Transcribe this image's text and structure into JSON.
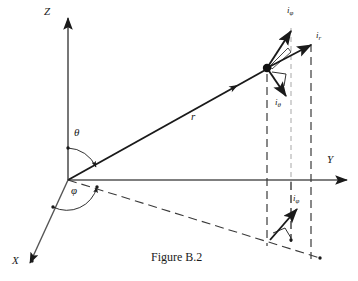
{
  "figure": {
    "caption": "Figure B.2",
    "caption_x": 151,
    "caption_y": 251,
    "background": "#ffffff",
    "stroke": "#1a1a1a",
    "dash_stroke": "#555555"
  },
  "axes": [
    {
      "name": "z-axis",
      "label": "Z",
      "label_x": 48,
      "label_y": 12,
      "x1": 68,
      "y1": 180,
      "x2": 68,
      "y2": 18
    },
    {
      "name": "y-axis",
      "label": "Y",
      "label_x": 329,
      "label_y": 160,
      "x1": 68,
      "y1": 180,
      "x2": 347,
      "y2": 180
    },
    {
      "name": "x-axis",
      "label": "X",
      "label_x": 14,
      "label_y": 261,
      "x1": 68,
      "y1": 180,
      "x2": 30,
      "y2": 265
    }
  ],
  "angles": [
    {
      "name": "theta",
      "label": "θ",
      "label_x": 74,
      "label_y": 130
    },
    {
      "name": "phi",
      "label": "φ",
      "label_x": 72,
      "label_y": 188
    }
  ],
  "radial_vector": {
    "name": "r-vector",
    "label": "r",
    "label_x": 192,
    "label_y": 113,
    "x1": 68,
    "y1": 180,
    "x2": 267,
    "y2": 68
  },
  "point": {
    "name": "point-p",
    "x": 267,
    "y": 68,
    "radius": 4
  },
  "unit_vectors": [
    {
      "id": "i-phi-upper",
      "label": "i",
      "subscript": "φ",
      "label_x": 288,
      "label_y": 8,
      "x1": 267,
      "y1": 68,
      "x2": 292,
      "y2": 31
    },
    {
      "id": "i-r",
      "label": "i",
      "subscript": "r",
      "label_x": 317,
      "label_y": 34,
      "x1": 267,
      "y1": 68,
      "x2": 310,
      "y2": 45
    },
    {
      "id": "i-theta",
      "label": "i",
      "subscript": "θ",
      "label_x": 276,
      "label_y": 100,
      "x1": 267,
      "y1": 68,
      "x2": 285,
      "y2": 95
    },
    {
      "id": "i-phi-lower",
      "label": "i",
      "subscript": "φ",
      "label_x": 294,
      "label_y": 196,
      "x1": 271,
      "y1": 240,
      "x2": 297,
      "y2": 210
    }
  ],
  "projection_lines": [
    {
      "name": "xy-projection-dashed",
      "x1": 68,
      "y1": 180,
      "x2": 306,
      "y2": 253
    },
    {
      "name": "vertical-drop-p",
      "x1": 267,
      "y1": 72,
      "x2": 267,
      "y2": 245
    },
    {
      "name": "vertical-gray-mid",
      "x1": 291,
      "y1": 30,
      "x2": 291,
      "y2": 222
    },
    {
      "name": "vertical-right",
      "x1": 311,
      "y1": 46,
      "x2": 311,
      "y2": 257
    }
  ],
  "tick_dots": [
    {
      "name": "dot-phi-arc-xy",
      "x": 97,
      "y": 187
    },
    {
      "name": "dot-theta-arc",
      "x": 68,
      "y": 148
    },
    {
      "name": "dot-x-arc",
      "x": 53,
      "y": 207
    },
    {
      "name": "dot-proj-end",
      "x": 306,
      "y": 253
    },
    {
      "name": "dot-proj-base",
      "x": 291,
      "y": 240
    },
    {
      "name": "dot-y-end",
      "x": 347,
      "y": 180
    }
  ],
  "right_angle_markers": [
    {
      "name": "right-angle-upper",
      "cx": 278,
      "cy": 78
    },
    {
      "name": "right-angle-lower",
      "cx": 281,
      "cy": 233
    },
    {
      "name": "right-angle-small",
      "cx": 272,
      "cy": 58
    }
  ]
}
